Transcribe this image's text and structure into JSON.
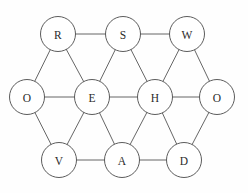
{
  "figure": {
    "title": "",
    "background_color": "#fefefe",
    "width": 248,
    "height": 193
  },
  "chart_data": {
    "type": "diagram",
    "diagram_kind": "node-link-graph",
    "title": "",
    "xlabel": "",
    "ylabel": "",
    "grid": false,
    "legend": false,
    "node_radius": 17.5,
    "node_fill": "#ffffff",
    "node_stroke": "#4a4a4a",
    "edge_stroke": "#555555",
    "label_color": "#2b2b2b",
    "nodes": [
      {
        "id": "R",
        "label": "R",
        "x": 58,
        "y": 34,
        "row": "top",
        "degree": 3
      },
      {
        "id": "S",
        "label": "S",
        "x": 123,
        "y": 34,
        "row": "top",
        "degree": 4
      },
      {
        "id": "W",
        "label": "W",
        "x": 187,
        "y": 34,
        "row": "top",
        "degree": 3
      },
      {
        "id": "O1",
        "label": "O",
        "x": 27,
        "y": 97,
        "row": "middle",
        "degree": 3
      },
      {
        "id": "E",
        "label": "E",
        "x": 92,
        "y": 97,
        "row": "middle",
        "degree": 6
      },
      {
        "id": "H",
        "label": "H",
        "x": 155,
        "y": 97,
        "row": "middle",
        "degree": 6
      },
      {
        "id": "O2",
        "label": "O",
        "x": 217,
        "y": 97,
        "row": "middle",
        "degree": 3
      },
      {
        "id": "V",
        "label": "V",
        "x": 59,
        "y": 160,
        "row": "bottom",
        "degree": 3
      },
      {
        "id": "A",
        "label": "A",
        "x": 122,
        "y": 160,
        "row": "bottom",
        "degree": 4
      },
      {
        "id": "D",
        "label": "D",
        "x": 184,
        "y": 160,
        "row": "bottom",
        "degree": 3
      }
    ],
    "edges": [
      {
        "source": "R",
        "target": "S"
      },
      {
        "source": "S",
        "target": "W"
      },
      {
        "source": "O1",
        "target": "E"
      },
      {
        "source": "E",
        "target": "H"
      },
      {
        "source": "H",
        "target": "O2"
      },
      {
        "source": "V",
        "target": "A"
      },
      {
        "source": "A",
        "target": "D"
      },
      {
        "source": "O1",
        "target": "R"
      },
      {
        "source": "R",
        "target": "E"
      },
      {
        "source": "E",
        "target": "S"
      },
      {
        "source": "S",
        "target": "H"
      },
      {
        "source": "H",
        "target": "W"
      },
      {
        "source": "W",
        "target": "O2"
      },
      {
        "source": "O1",
        "target": "V"
      },
      {
        "source": "V",
        "target": "E"
      },
      {
        "source": "E",
        "target": "A"
      },
      {
        "source": "A",
        "target": "H"
      },
      {
        "source": "H",
        "target": "D"
      },
      {
        "source": "D",
        "target": "O2"
      }
    ],
    "node_count": 10,
    "edge_count": 19
  }
}
